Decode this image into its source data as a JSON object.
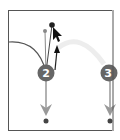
{
  "diagram": {
    "nodes": [
      {
        "id": "node-2",
        "label": "2",
        "color": "#666666"
      },
      {
        "id": "node-3",
        "label": "3",
        "color": "#666666"
      }
    ],
    "colors": {
      "frame": "#555555",
      "curve": "#555555",
      "arrow": "#999999",
      "faint_arc": "#eeeeee",
      "handle": "#333333",
      "cursor": "#111111"
    }
  }
}
